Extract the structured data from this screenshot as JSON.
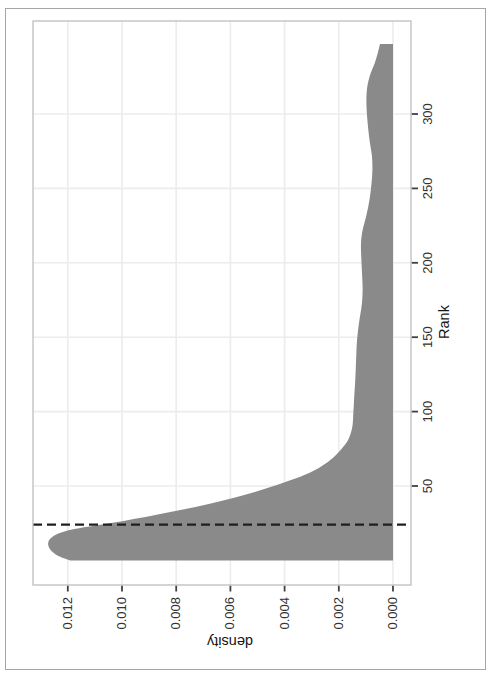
{
  "page": {
    "background": "#ffffff",
    "border_color": "#a6a6a6"
  },
  "chart_data": {
    "type": "area",
    "title": "",
    "xlabel": "Rank",
    "ylabel": "density",
    "orientation": "whole chart printed rotated 90 degrees counterclockwise on portrait page",
    "xlim": [
      -16,
      363
    ],
    "ylim": [
      -0.00066,
      0.01328
    ],
    "grid": "major-only",
    "legend": "none",
    "x_ticks": {
      "values": [
        50,
        100,
        150,
        200,
        250,
        300
      ],
      "labels": [
        "50",
        "100",
        "150",
        "200",
        "250",
        "300"
      ]
    },
    "y_ticks": {
      "values": [
        0.0,
        0.002,
        0.004,
        0.006,
        0.008,
        0.01,
        0.012
      ],
      "labels": [
        "0.000",
        "0.002",
        "0.004",
        "0.006",
        "0.008",
        "0.010",
        "0.012"
      ]
    },
    "vline": {
      "x": 24,
      "style": "dashed",
      "color": "#1f1f1f",
      "width": 2.2
    },
    "colors": {
      "fill": "#8a8a8a",
      "panel_border": "#bdbdbd",
      "gridline": "#ececec",
      "tick": "#404040",
      "label": "#333333",
      "title": "#141414"
    },
    "series": [
      {
        "name": "density of Rank",
        "points": [
          [
            0,
            0.0119
          ],
          [
            3,
            0.01235
          ],
          [
            6,
            0.01258
          ],
          [
            9,
            0.0127
          ],
          [
            12,
            0.01272
          ],
          [
            15,
            0.01262
          ],
          [
            18,
            0.01235
          ],
          [
            21,
            0.0118
          ],
          [
            24,
            0.0108
          ],
          [
            27,
            0.0098
          ],
          [
            30,
            0.0089
          ],
          [
            34,
            0.0078
          ],
          [
            38,
            0.0068
          ],
          [
            42,
            0.0059
          ],
          [
            46,
            0.0051
          ],
          [
            50,
            0.0044
          ],
          [
            55,
            0.0036
          ],
          [
            60,
            0.00295
          ],
          [
            65,
            0.0025
          ],
          [
            70,
            0.00215
          ],
          [
            76,
            0.00185
          ],
          [
            82,
            0.00163
          ],
          [
            90,
            0.0015
          ],
          [
            100,
            0.00146
          ],
          [
            110,
            0.00143
          ],
          [
            122,
            0.00139
          ],
          [
            135,
            0.00136
          ],
          [
            148,
            0.00133
          ],
          [
            160,
            0.00125
          ],
          [
            172,
            0.00115
          ],
          [
            182,
            0.00112
          ],
          [
            192,
            0.00114
          ],
          [
            203,
            0.00117
          ],
          [
            213,
            0.00118
          ],
          [
            222,
            0.00112
          ],
          [
            232,
            0.00098
          ],
          [
            242,
            0.00087
          ],
          [
            252,
            0.0008
          ],
          [
            262,
            0.00076
          ],
          [
            272,
            0.00078
          ],
          [
            283,
            0.00087
          ],
          [
            295,
            0.00094
          ],
          [
            307,
            0.00098
          ],
          [
            317,
            0.00096
          ],
          [
            326,
            0.00085
          ],
          [
            334,
            0.00068
          ],
          [
            341,
            0.00056
          ],
          [
            347,
            0.00048
          ]
        ]
      }
    ]
  }
}
